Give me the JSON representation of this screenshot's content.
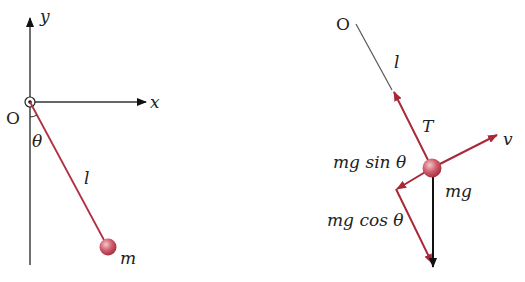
{
  "colors": {
    "axis": "#333333",
    "rod": "#b03040",
    "force": "#a82838",
    "gravity": "#111111",
    "bob": "#c85060"
  },
  "left_diagram": {
    "axis_y_label": "y",
    "axis_x_label": "x",
    "origin_label": "O",
    "angle_label": "θ",
    "length_label": "l",
    "mass_label": "m"
  },
  "right_diagram": {
    "origin_label": "O",
    "length_label": "l",
    "tension_label": "T",
    "velocity_label": "v",
    "sin_component_label_pre": "mg sin ",
    "sin_component_label_theta": "θ",
    "cos_component_label_pre": "mg cos ",
    "cos_component_label_theta": "θ",
    "gravity_label": "mg"
  }
}
